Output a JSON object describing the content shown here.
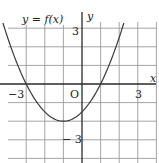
{
  "diagram": {
    "function_label": "y = f(x)",
    "x_axis_label": "x",
    "y_axis_label": "y",
    "origin_label": "O",
    "tick_labels": {
      "x_neg": "−3",
      "x_pos": "3",
      "y_pos": "3",
      "y_neg": "− 3"
    },
    "grid": {
      "x_min": -3,
      "x_max": 3,
      "y_min": -3,
      "y_max": 3,
      "step": 1
    },
    "curve": {
      "type": "parabola",
      "equation": "y = 0.5(x + 3)(x − 1)",
      "roots": [
        -3,
        1
      ],
      "vertex": [
        -1,
        -2
      ],
      "y_intercept": -1.5
    },
    "colors": {
      "grid": "#9a9a9a",
      "axis": "#2a2a2a",
      "curve": "#3a3a3a"
    }
  }
}
